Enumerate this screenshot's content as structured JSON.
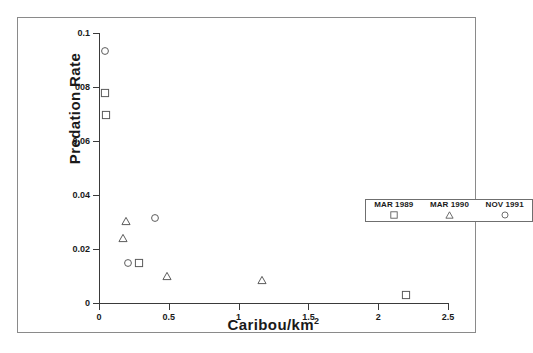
{
  "chart_data": {
    "type": "scatter",
    "title": "",
    "xlabel": "Caribou/km",
    "xlabel_sup": "2",
    "ylabel": "Predation Rate",
    "xlim": [
      0,
      2.5
    ],
    "ylim": [
      0,
      0.1
    ],
    "grid": false,
    "xticks": [
      "0",
      "0.5",
      "1",
      "1.5",
      "2",
      "2.5"
    ],
    "xtick_values": [
      0,
      0.5,
      1,
      1.5,
      2,
      2.5
    ],
    "yticks": [
      "0",
      "0.02",
      "0.04",
      "0.06",
      "008",
      "0.1"
    ],
    "ytick_values": [
      0,
      0.02,
      0.04,
      0.06,
      0.08,
      0.1
    ],
    "legend_position": "center-right",
    "series": [
      {
        "name": "MAR 1989",
        "marker": "square",
        "points": [
          {
            "x": 0.04,
            "y": 0.0778
          },
          {
            "x": 0.05,
            "y": 0.0696
          },
          {
            "x": 0.29,
            "y": 0.015
          },
          {
            "x": 2.2,
            "y": 0.003
          }
        ]
      },
      {
        "name": "MAR 1990",
        "marker": "triangle",
        "points": [
          {
            "x": 0.19,
            "y": 0.0305
          },
          {
            "x": 0.17,
            "y": 0.024
          },
          {
            "x": 0.49,
            "y": 0.01
          },
          {
            "x": 1.17,
            "y": 0.0085
          }
        ]
      },
      {
        "name": "NOV 1991",
        "marker": "circle",
        "points": [
          {
            "x": 0.04,
            "y": 0.0933
          },
          {
            "x": 0.4,
            "y": 0.0315
          },
          {
            "x": 0.21,
            "y": 0.015
          }
        ]
      }
    ]
  },
  "legend": {
    "entries": [
      {
        "label": "MAR 1989",
        "marker": "square"
      },
      {
        "label": "MAR 1990",
        "marker": "triangle"
      },
      {
        "label": "NOV 1991",
        "marker": "circle"
      }
    ]
  },
  "colors": {
    "marker_stroke": "#5a5a5a",
    "axis": "#3a3a3a",
    "frame": "#8a8a8a",
    "text": "#1a1a1a",
    "background": "#ffffff"
  }
}
